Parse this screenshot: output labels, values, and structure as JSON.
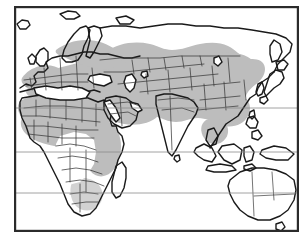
{
  "figure": {
    "type": "species-distribution-map",
    "projection": "equirectangular",
    "title": "",
    "width_px": 307,
    "height_px": 240,
    "background_color": "#ffffff"
  },
  "frame": {
    "name": "map-border",
    "stroke_color": "#2b2b2b",
    "stroke_width_px": 2.2,
    "fill_color": "#ffffff",
    "x": 14,
    "y": 6,
    "width": 285,
    "height": 226
  },
  "legend": {
    "visible": false,
    "entries": [
      {
        "label": "Distribution range",
        "swatch_color": "#bdbdbd"
      },
      {
        "label": "Outside range",
        "swatch_color": "#ffffff"
      }
    ]
  },
  "graticule": {
    "name": "latitude-lines",
    "stroke_color": "#8c8c8c",
    "stroke_width_px": 0.8,
    "lines": [
      {
        "name": "tropic-of-cancer",
        "label": "Tropic of Cancer",
        "latitude": 23.44,
        "y_px": 108
      },
      {
        "name": "equator",
        "label": "Equator",
        "latitude": 0,
        "y_px": 152
      },
      {
        "name": "tropic-of-capricorn",
        "label": "Tropic of Capricorn",
        "latitude": -23.44,
        "y_px": 193
      }
    ]
  },
  "colors": {
    "range_fill": "#bdbdbd",
    "range_fill_light": "#d2d2d2",
    "land_fill": "#ffffff",
    "coastline": "#1a1a1a",
    "country_border": "#3a3a3a",
    "ocean_fill": "#ffffff",
    "frame": "#2b2b2b",
    "graticule": "#8c8c8c"
  },
  "chart_data": {
    "type": "map",
    "title": "",
    "xlabel": "",
    "ylabel": "",
    "regions_in_range": [
      "Northern Africa",
      "Sahel",
      "West Africa (savanna)",
      "East Africa",
      "Southern Africa (patchy)",
      "Iberian Peninsula",
      "Western Europe",
      "Central Europe",
      "Eastern Europe",
      "Anatolia",
      "Levant",
      "Arabian Peninsula",
      "Caucasus",
      "Central Asia",
      "Iran",
      "Afghanistan",
      "Mongolia",
      "Northern China",
      "Southern China",
      "Southern Siberia"
    ],
    "regions_outside_range": [
      "Congo Basin",
      "Indian subcontinent (core)",
      "Scandinavia (north)",
      "Northern Siberia",
      "Japan",
      "Korea",
      "Maritime Southeast Asia",
      "New Guinea",
      "Australia",
      "Madagascar",
      "Iceland"
    ]
  },
  "landmasses": [
    {
      "name": "africa",
      "label": "Africa"
    },
    {
      "name": "europe",
      "label": "Europe"
    },
    {
      "name": "asia",
      "label": "Asia"
    },
    {
      "name": "australia",
      "label": "Australia"
    },
    {
      "name": "madagascar",
      "label": "Madagascar"
    },
    {
      "name": "japan",
      "label": "Japan"
    },
    {
      "name": "new-guinea",
      "label": "New Guinea"
    },
    {
      "name": "philippines",
      "label": "Philippines"
    },
    {
      "name": "indonesia",
      "label": "Indonesia"
    },
    {
      "name": "iceland",
      "label": "Iceland"
    },
    {
      "name": "british-isles",
      "label": "British Isles"
    },
    {
      "name": "sri-lanka",
      "label": "Sri Lanka"
    },
    {
      "name": "tasmania",
      "label": "Tasmania"
    },
    {
      "name": "new-zealand",
      "label": "New Zealand"
    }
  ]
}
